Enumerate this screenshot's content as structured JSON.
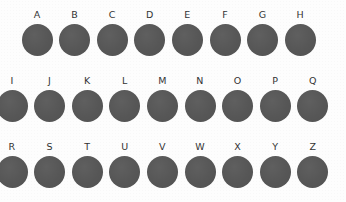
{
  "figure": {
    "width": 346,
    "height": 202,
    "background_color": "#fdfdfd",
    "blob_color": "#565656",
    "label_color": "#333333",
    "blob_icon_name": "filled-circle-shape"
  },
  "rows": [
    {
      "row_index": 1,
      "first_center_x": 37,
      "step_x": 37.6,
      "top": 0,
      "clipped_left": false,
      "cells": [
        {
          "label": "A"
        },
        {
          "label": "B"
        },
        {
          "label": "C"
        },
        {
          "label": "D"
        },
        {
          "label": "E"
        },
        {
          "label": "F"
        },
        {
          "label": "G"
        },
        {
          "label": "H"
        }
      ]
    },
    {
      "row_index": 2,
      "first_center_x": 12,
      "step_x": 37.6,
      "top": 66,
      "clipped_left": true,
      "cells": [
        {
          "label": "I"
        },
        {
          "label": "J"
        },
        {
          "label": "K"
        },
        {
          "label": "L"
        },
        {
          "label": "M"
        },
        {
          "label": "N"
        },
        {
          "label": "O"
        },
        {
          "label": "P"
        },
        {
          "label": "Q"
        }
      ]
    },
    {
      "row_index": 3,
      "first_center_x": 12,
      "step_x": 37.6,
      "top": 132,
      "clipped_left": true,
      "cells": [
        {
          "label": "R"
        },
        {
          "label": "S"
        },
        {
          "label": "T"
        },
        {
          "label": "U"
        },
        {
          "label": "V"
        },
        {
          "label": "W"
        },
        {
          "label": "X"
        },
        {
          "label": "Y"
        },
        {
          "label": "Z"
        }
      ]
    }
  ]
}
